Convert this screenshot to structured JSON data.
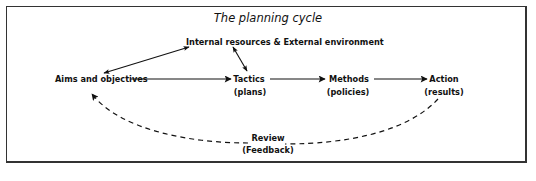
{
  "diagram": {
    "title": "The planning cycle",
    "nodes": {
      "environment": "Internal resources & External environment",
      "aims": "Aims and objectives",
      "tactics": "Tactics",
      "tactics_sub": "(plans)",
      "methods": "Methods",
      "methods_sub": "(policies)",
      "action": "Action",
      "action_sub": "(results)",
      "review": "Review",
      "review_sub": "(Feedback)"
    },
    "edges": [
      {
        "from": "aims",
        "to": "environment",
        "style": "solid",
        "bidirectional": true
      },
      {
        "from": "environment",
        "to": "tactics",
        "style": "solid",
        "bidirectional": true
      },
      {
        "from": "aims",
        "to": "tactics",
        "style": "solid",
        "bidirectional": false
      },
      {
        "from": "tactics",
        "to": "methods",
        "style": "solid",
        "bidirectional": false
      },
      {
        "from": "methods",
        "to": "action",
        "style": "solid",
        "bidirectional": false
      },
      {
        "from": "action",
        "to": "aims",
        "via": "review",
        "style": "dashed",
        "bidirectional": false
      }
    ]
  }
}
